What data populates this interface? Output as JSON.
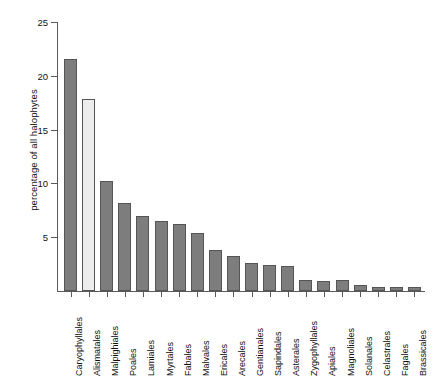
{
  "chart_data": {
    "type": "bar",
    "title": "",
    "subtitle": "",
    "xlabel": "",
    "ylabel": "percentage of all halophytes",
    "ylim": [
      0,
      25
    ],
    "yticks": [
      0,
      5,
      10,
      15,
      20,
      25
    ],
    "ytick_labels": [
      "",
      "5",
      "10",
      "15",
      "20",
      "25"
    ],
    "grid": false,
    "legend": null,
    "categories": [
      "Caryophyllales",
      "Alismatales",
      "Malpighiales",
      "Poales",
      "Lamiales",
      "Myrtales",
      "Fabales",
      "Malvales",
      "Ericales",
      "Arecales",
      "Gentianales",
      "Sapindales",
      "Asterales",
      "Zygophyllales",
      "Apiales",
      "Magnoliales",
      "Solanales",
      "Celastrales",
      "Fagales",
      "Brassicales"
    ],
    "values": [
      21.6,
      17.8,
      10.2,
      8.2,
      7.0,
      6.5,
      6.2,
      5.4,
      3.8,
      3.3,
      2.6,
      2.4,
      2.3,
      1.0,
      0.9,
      1.0,
      0.6,
      0.4,
      0.4,
      0.4
    ],
    "bar_colors": [
      "#7d7d7d",
      "#ededed",
      "#7d7d7d",
      "#7d7d7d",
      "#7d7d7d",
      "#7d7d7d",
      "#7d7d7d",
      "#7d7d7d",
      "#7d7d7d",
      "#7d7d7d",
      "#7d7d7d",
      "#7d7d7d",
      "#7d7d7d",
      "#7d7d7d",
      "#7d7d7d",
      "#7d7d7d",
      "#7d7d7d",
      "#7d7d7d",
      "#7d7d7d",
      "#7d7d7d"
    ],
    "highlighted_category": "Alismatales",
    "bar_edge_color": "#555555",
    "axis_color": "#5a5a5a"
  }
}
